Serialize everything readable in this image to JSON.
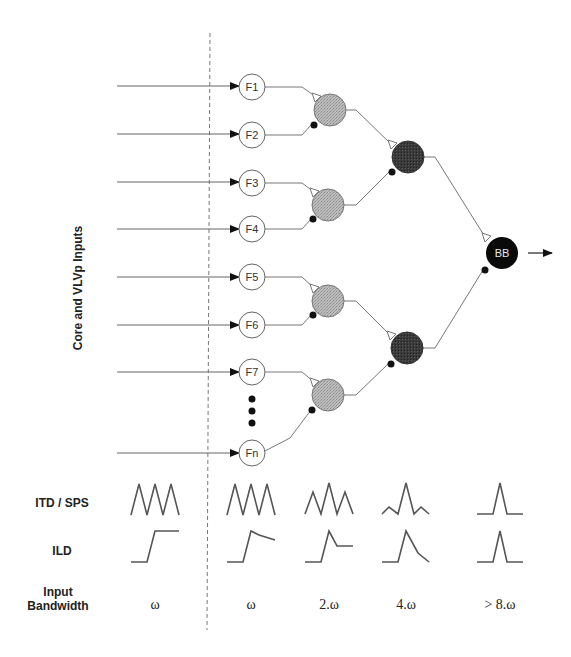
{
  "axis_label": "Core and VLVp Inputs",
  "colors": {
    "input_node_fill": "#ffffff",
    "level1_fill": "#b5b5b5",
    "level2_fill": "#3a3a3a",
    "output_fill": "#0a0a0a",
    "wire": "#777777"
  },
  "input_nodes": [
    {
      "label": "F1",
      "x": 252,
      "y": 87
    },
    {
      "label": "F2",
      "x": 252,
      "y": 135
    },
    {
      "label": "F3",
      "x": 252,
      "y": 183
    },
    {
      "label": "F4",
      "x": 252,
      "y": 229
    },
    {
      "label": "F5",
      "x": 252,
      "y": 277
    },
    {
      "label": "F6",
      "x": 252,
      "y": 325
    },
    {
      "label": "F7",
      "x": 252,
      "y": 372
    },
    {
      "label": "Fn",
      "x": 252,
      "y": 453
    }
  ],
  "ellipsis": "⋮",
  "level1_nodes": [
    {
      "x": 330,
      "y": 110
    },
    {
      "x": 328,
      "y": 205
    },
    {
      "x": 328,
      "y": 301
    },
    {
      "x": 328,
      "y": 395
    }
  ],
  "level2_nodes": [
    {
      "x": 408,
      "y": 157
    },
    {
      "x": 407,
      "y": 348
    }
  ],
  "output_node": {
    "label": "BB",
    "x": 502,
    "y": 253
  },
  "synapse_legend": {
    "excitatory": "open-triangle",
    "inhibitory": "filled-dot"
  },
  "rows": {
    "itd_label": "ITD / SPS",
    "ild_label": "ILD",
    "bandwidth_label_line1": "Input",
    "bandwidth_label_line2": "Bandwidth"
  },
  "columns": [
    {
      "name": "input",
      "itd_shape": "three equal peaks",
      "ild_shape": "step",
      "bandwidth": "ω"
    },
    {
      "name": "F-layer",
      "itd_shape": "three equal peaks",
      "ild_shape": "step with decay",
      "bandwidth": "ω"
    },
    {
      "name": "level-1",
      "itd_shape": "central peak taller",
      "ild_shape": "peak then plateau",
      "bandwidth": "2.ω"
    },
    {
      "name": "level-2",
      "itd_shape": "single peak small side lobes",
      "ild_shape": "peak with slow decay",
      "bandwidth": "4.ω"
    },
    {
      "name": "BB",
      "itd_shape": "single peak",
      "ild_shape": "single peak",
      "bandwidth": "> 8.ω"
    }
  ]
}
